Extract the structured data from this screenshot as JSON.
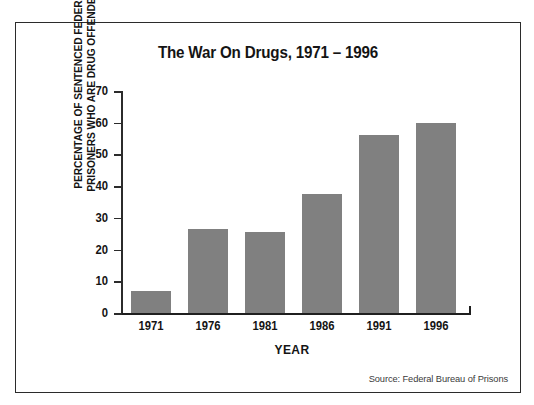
{
  "chart_data": {
    "type": "bar",
    "title": "The War On Drugs, 1971 – 1996",
    "xlabel": "YEAR",
    "ylabel_line1": "PERCENTAGE OF SENTENCED FEDERAL",
    "ylabel_line2": "PRISONERS WHO ARE DRUG OFFENDERS",
    "categories": [
      "1971",
      "1976",
      "1981",
      "1986",
      "1991",
      "1996"
    ],
    "values": [
      7,
      26.5,
      25.5,
      37.5,
      56,
      60
    ],
    "ylim": [
      0,
      70
    ],
    "ytick_values": [
      0,
      10,
      20,
      30,
      40,
      50,
      60,
      70
    ],
    "ytick_labels": [
      "0",
      "10",
      "20",
      "30",
      "40",
      "50",
      "60",
      "70"
    ],
    "grid": false,
    "legend": null,
    "bar_color": "#808080",
    "axis_color": "#2b2b2b",
    "background_color": "#ffffff"
  },
  "source": {
    "note": "Source: Federal Bureau of Prisons"
  }
}
